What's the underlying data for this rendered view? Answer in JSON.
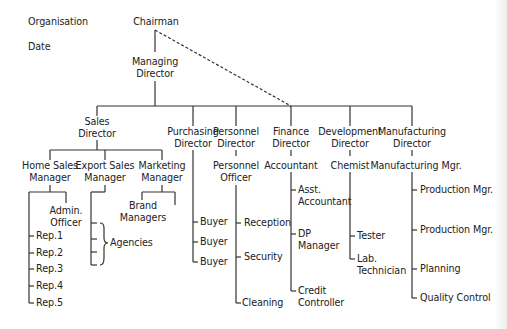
{
  "header": {
    "organisation_label": "Organisation",
    "date_label": "Date"
  },
  "nodes": {
    "chairman": "Chairman",
    "managing_director": [
      "Managing",
      "Director"
    ],
    "sales_director": [
      "Sales",
      "Director"
    ],
    "purchasing_director": [
      "Purchasing",
      "Director"
    ],
    "personnel_director": [
      "Personnel",
      "Director"
    ],
    "finance_director": [
      "Finance",
      "Director"
    ],
    "development_director": [
      "Development",
      "Director"
    ],
    "manufacturing_director": [
      "Manufacturing",
      "Director"
    ],
    "home_sales_manager": [
      "Home Sales",
      "Manager"
    ],
    "export_sales_manager": [
      "Export Sales",
      "Manager"
    ],
    "marketing_manager": [
      "Marketing",
      "Manager"
    ],
    "personnel_officer": [
      "Personnel",
      "Officer"
    ],
    "accountant": "Accountant",
    "chemist": "Chemist",
    "manufacturing_mgr": "Manufacturing Mgr.",
    "admin_officer": [
      "Admin.",
      "Officer"
    ],
    "brand_managers": [
      "Brand",
      "Managers"
    ],
    "agencies": "Agencies",
    "reps": [
      "Rep.1",
      "Rep.2",
      "Rep.3",
      "Rep.4",
      "Rep.5"
    ],
    "buyers": [
      "Buyer",
      "Buyer",
      "Buyer"
    ],
    "personnel_staff": [
      "Reception",
      "Security",
      "Cleaning"
    ],
    "asst_accountant": [
      "Asst.",
      "Accountant"
    ],
    "dp_manager": [
      "DP",
      "Manager"
    ],
    "credit_controller": [
      "Credit",
      "Controller"
    ],
    "tester": "Tester",
    "lab_technician": [
      "Lab.",
      "Technician"
    ],
    "manufacturing_staff": [
      "Production Mgr.",
      "Production Mgr.",
      "Planning",
      "Quality Control"
    ]
  },
  "style": {
    "line_color": "#333333",
    "text_color": "#222222"
  }
}
